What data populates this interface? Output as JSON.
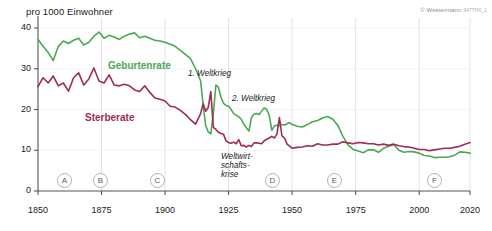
{
  "chart_data": {
    "type": "line",
    "title": "",
    "ylabel": "pro 1000 Einwohner",
    "xlabel": "",
    "xlim": [
      1850,
      2020
    ],
    "ylim": [
      0,
      40
    ],
    "yticks": [
      0,
      10,
      20,
      30,
      40
    ],
    "xticks": [
      1850,
      1875,
      1900,
      1925,
      1950,
      1975,
      2000,
      2020
    ],
    "grid": true,
    "legend_position": "inline",
    "series": [
      {
        "name": "Geburtenrate",
        "color": "#4aa855",
        "label_x": 108,
        "label_y": 60,
        "x": [
          1850,
          1852,
          1854,
          1856,
          1858,
          1860,
          1862,
          1864,
          1866,
          1868,
          1870,
          1872,
          1874,
          1876,
          1878,
          1880,
          1882,
          1884,
          1886,
          1888,
          1890,
          1892,
          1894,
          1896,
          1898,
          1900,
          1902,
          1904,
          1906,
          1908,
          1910,
          1912,
          1914,
          1915,
          1916,
          1917,
          1918,
          1919,
          1920,
          1921,
          1922,
          1923,
          1924,
          1925,
          1926,
          1927,
          1928,
          1929,
          1930,
          1931,
          1932,
          1933,
          1934,
          1935,
          1936,
          1937,
          1938,
          1939,
          1940,
          1941,
          1942,
          1943,
          1944,
          1945,
          1946,
          1947,
          1948,
          1949,
          1950,
          1952,
          1954,
          1956,
          1958,
          1960,
          1962,
          1964,
          1966,
          1968,
          1970,
          1972,
          1974,
          1976,
          1978,
          1980,
          1982,
          1984,
          1986,
          1988,
          1990,
          1992,
          1994,
          1996,
          1998,
          2000,
          2002,
          2004,
          2006,
          2008,
          2010,
          2012,
          2014,
          2016,
          2018,
          2020
        ],
        "y": [
          37.2,
          35.5,
          34.0,
          32.0,
          35.5,
          36.8,
          36.2,
          37.0,
          37.5,
          35.8,
          36.5,
          38.0,
          39.0,
          37.5,
          38.2,
          37.8,
          37.2,
          38.0,
          38.5,
          38.8,
          37.6,
          38.0,
          37.5,
          37.0,
          36.8,
          36.5,
          36.0,
          35.5,
          34.5,
          33.5,
          32.5,
          30.0,
          27.0,
          21.0,
          16.0,
          14.5,
          14.0,
          19.0,
          26.0,
          25.5,
          23.0,
          21.5,
          21.0,
          20.8,
          20.0,
          19.0,
          18.6,
          18.2,
          17.6,
          16.4,
          15.5,
          14.7,
          18.0,
          18.9,
          19.0,
          18.8,
          19.6,
          20.4,
          20.0,
          18.6,
          14.9,
          16.0,
          16.1,
          16.1,
          16.3,
          16.2,
          16.5,
          16.8,
          16.3,
          15.9,
          15.7,
          16.3,
          17.0,
          17.3,
          17.9,
          18.3,
          17.6,
          16.1,
          13.4,
          11.3,
          10.2,
          9.8,
          9.4,
          10.1,
          10.1,
          9.5,
          10.5,
          11.0,
          11.4,
          10.0,
          9.5,
          9.7,
          9.6,
          9.3,
          8.7,
          8.6,
          8.2,
          8.3,
          8.3,
          8.4,
          8.8,
          9.6,
          9.5,
          9.3
        ]
      },
      {
        "name": "Sterberate",
        "color": "#9e2b56",
        "label_x": 85,
        "label_y": 112,
        "x": [
          1850,
          1852,
          1854,
          1856,
          1858,
          1860,
          1862,
          1864,
          1866,
          1868,
          1870,
          1872,
          1874,
          1876,
          1878,
          1880,
          1882,
          1884,
          1886,
          1888,
          1890,
          1892,
          1894,
          1896,
          1898,
          1900,
          1902,
          1904,
          1906,
          1908,
          1910,
          1912,
          1914,
          1915,
          1916,
          1917,
          1918,
          1919,
          1920,
          1921,
          1922,
          1923,
          1924,
          1925,
          1926,
          1927,
          1928,
          1929,
          1930,
          1931,
          1932,
          1933,
          1934,
          1935,
          1936,
          1937,
          1938,
          1939,
          1940,
          1941,
          1942,
          1943,
          1944,
          1945,
          1946,
          1947,
          1948,
          1949,
          1950,
          1952,
          1954,
          1956,
          1958,
          1960,
          1962,
          1964,
          1966,
          1968,
          1970,
          1972,
          1974,
          1976,
          1978,
          1980,
          1982,
          1984,
          1986,
          1988,
          1990,
          1992,
          1994,
          1996,
          1998,
          2000,
          2002,
          2004,
          2006,
          2008,
          2010,
          2012,
          2014,
          2016,
          2018,
          2020
        ],
        "y": [
          25.6,
          27.8,
          26.5,
          28.2,
          25.8,
          26.5,
          24.5,
          27.8,
          29.0,
          26.0,
          27.5,
          30.2,
          27.0,
          26.5,
          28.5,
          26.0,
          25.8,
          26.2,
          25.8,
          24.8,
          24.4,
          25.8,
          24.2,
          22.8,
          22.5,
          22.1,
          20.8,
          20.6,
          19.8,
          18.8,
          17.5,
          16.4,
          19.0,
          21.4,
          19.6,
          20.5,
          24.4,
          15.6,
          15.1,
          14.4,
          14.1,
          13.9,
          12.3,
          11.9,
          11.7,
          12.0,
          11.6,
          12.6,
          11.1,
          11.2,
          10.8,
          11.2,
          10.9,
          11.8,
          11.8,
          11.7,
          11.6,
          12.3,
          12.7,
          13.0,
          13.4,
          13.0,
          13.9,
          18.0,
          13.5,
          13.0,
          11.5,
          11.0,
          10.5,
          10.7,
          10.8,
          11.1,
          11.0,
          11.6,
          11.3,
          11.3,
          11.5,
          11.5,
          12.1,
          11.8,
          11.6,
          11.9,
          11.8,
          11.6,
          11.6,
          11.3,
          11.5,
          11.2,
          11.5,
          11.1,
          10.9,
          10.8,
          10.5,
          10.2,
          10.2,
          9.9,
          10.1,
          10.3,
          10.5,
          10.5,
          10.7,
          11.0,
          11.5,
          11.9
        ]
      }
    ],
    "annotations": [
      {
        "text": "1. Weltkrieg",
        "x": 188,
        "y": 69,
        "lines": [
          "1. Weltkrieg"
        ]
      },
      {
        "text": "2. Weltkrieg",
        "x": 232,
        "y": 94,
        "lines": [
          "2. Weltkrieg"
        ]
      },
      {
        "text": "Weltwirtschaftskrise",
        "x": 221,
        "y": 152,
        "lines": [
          "Weltwirt-",
          "schafts-",
          "krise"
        ]
      }
    ],
    "markers": [
      {
        "label": "A",
        "x": 57
      },
      {
        "label": "B",
        "x": 93
      },
      {
        "label": "C",
        "x": 150
      },
      {
        "label": "D",
        "x": 265
      },
      {
        "label": "E",
        "x": 327
      },
      {
        "label": "F",
        "x": 427
      }
    ]
  },
  "header": {
    "copyright": "© Westermann",
    "code": "947THX_1"
  }
}
